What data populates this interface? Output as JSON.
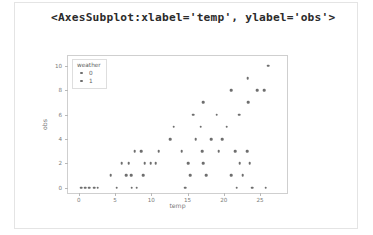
{
  "output": {
    "repr_text": "<AxesSubplot:xlabel='temp', ylabel='obs'>"
  },
  "legend": {
    "title": "weather",
    "entries": [
      {
        "label": "0",
        "marker": "circle-marker",
        "color": "#6e6e6e"
      },
      {
        "label": "1",
        "marker": "circle-marker",
        "color": "#6e6e6e"
      }
    ]
  },
  "chart_data": {
    "type": "scatter",
    "title": "",
    "xlabel": "temp",
    "ylabel": "obs",
    "xlim": [
      -1.5,
      29.0
    ],
    "ylim": [
      -0.6,
      10.8
    ],
    "xticks": [
      0,
      5,
      10,
      15,
      20,
      25
    ],
    "yticks": [
      0,
      2,
      4,
      6,
      8,
      10
    ],
    "grid": false,
    "legend_position": "upper left",
    "legend_title": "weather",
    "marker_color": "#6e6e6e",
    "series": [
      {
        "name": "0",
        "points": [
          [
            0.3,
            0
          ],
          [
            0.9,
            0
          ],
          [
            1.4,
            0
          ],
          [
            2.1,
            0
          ],
          [
            2.6,
            0
          ],
          [
            5.2,
            0
          ],
          [
            7.3,
            0
          ],
          [
            8.0,
            0
          ],
          [
            14.7,
            0
          ],
          [
            21.8,
            0
          ],
          [
            23.9,
            0
          ],
          [
            25.8,
            0
          ],
          [
            4.4,
            1
          ],
          [
            6.5,
            1
          ],
          [
            7.2,
            1
          ],
          [
            8.9,
            1
          ],
          [
            15.4,
            1
          ],
          [
            17.6,
            1
          ],
          [
            21.0,
            1
          ],
          [
            22.6,
            1
          ],
          [
            5.9,
            2
          ],
          [
            6.9,
            2
          ],
          [
            9.1,
            2
          ],
          [
            9.9,
            2
          ],
          [
            10.6,
            2
          ],
          [
            15.1,
            2
          ],
          [
            17.2,
            2
          ],
          [
            22.2,
            2
          ],
          [
            23.6,
            2
          ],
          [
            7.7,
            3
          ],
          [
            8.6,
            3
          ],
          [
            11.0,
            3
          ],
          [
            14.2,
            3
          ],
          [
            17.0,
            3
          ],
          [
            19.3,
            3
          ],
          [
            21.6,
            3
          ],
          [
            23.2,
            3
          ],
          [
            12.6,
            4
          ],
          [
            16.1,
            4
          ],
          [
            18.3,
            4
          ],
          [
            19.8,
            4
          ],
          [
            13.1,
            5
          ],
          [
            16.8,
            5
          ],
          [
            20.4,
            5
          ],
          [
            15.8,
            6
          ],
          [
            19.0,
            6
          ],
          [
            22.1,
            6
          ],
          [
            17.2,
            7
          ],
          [
            23.4,
            7
          ],
          [
            21.0,
            8
          ],
          [
            24.6,
            8
          ],
          [
            25.6,
            8
          ],
          [
            23.3,
            9
          ],
          [
            26.1,
            10
          ]
        ]
      },
      {
        "name": "1",
        "points": []
      }
    ]
  }
}
